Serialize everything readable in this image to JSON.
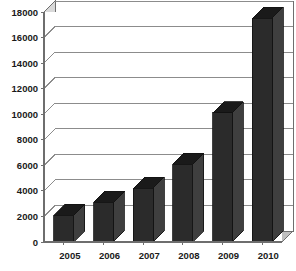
{
  "chart_data": {
    "type": "bar",
    "title": "",
    "subtitle": "",
    "xlabel": "",
    "ylabel": "",
    "categories": [
      "2005",
      "2006",
      "2007",
      "2008",
      "2009",
      "2010"
    ],
    "values": [
      2100,
      3100,
      4200,
      6100,
      10100,
      17500
    ],
    "series": [
      {
        "name": "",
        "values": [
          2100,
          3100,
          4200,
          6100,
          10100,
          17500
        ]
      }
    ],
    "ylim": [
      0,
      18000
    ],
    "yticks": [
      0,
      2000,
      4000,
      6000,
      8000,
      10000,
      12000,
      14000,
      16000,
      18000
    ],
    "ytick_labels": [
      "0",
      "2000",
      "4000",
      "6000",
      "8000",
      "10000",
      "12000",
      "14000",
      "16000",
      "18000"
    ],
    "xtick_labels": [
      "2005",
      "2006",
      "2007",
      "2008",
      "2009",
      "2010"
    ],
    "grid": true,
    "grid_axis": "y",
    "legend": false,
    "legend_position": "none",
    "annotations": [],
    "style": {
      "three_d": true,
      "bar_face_color": "#2b2b2b",
      "bar_top_color": "#1a1a1a",
      "bar_side_color": "#3f3f3f",
      "plot_background": "#ffffff",
      "grid_color": "#8c8c8c",
      "axis_color": "#6e6e6e",
      "wall_color": "#d9d9d9",
      "floor_color": "#bfbfbf",
      "tick_label_color": "#1a1a1a"
    }
  }
}
